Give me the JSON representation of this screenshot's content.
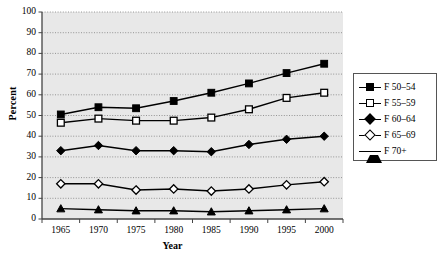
{
  "chart_data": {
    "type": "line",
    "title": "",
    "xlabel": "Year",
    "ylabel": "Percent",
    "categories": [
      "1965",
      "1970",
      "1975",
      "1980",
      "1985",
      "1990",
      "1995",
      "2000"
    ],
    "ylim": [
      0,
      100
    ],
    "yticks": [
      "0",
      "10",
      "20",
      "30",
      "40",
      "50",
      "60",
      "70",
      "80",
      "90",
      "100"
    ],
    "grid": true,
    "legend_position": "right",
    "plot_background": "#e8e8e8",
    "line_color": "#000000",
    "series": [
      {
        "name": "F 50–54",
        "marker": "filled-square",
        "values": [
          50.5,
          54.0,
          53.5,
          57.0,
          61.0,
          65.5,
          70.5,
          75.0
        ]
      },
      {
        "name": "F 55–59",
        "marker": "open-square",
        "values": [
          46.5,
          48.5,
          47.5,
          47.5,
          49.0,
          53.0,
          58.5,
          61.0
        ]
      },
      {
        "name": "F 60–64",
        "marker": "filled-diamond",
        "values": [
          33.0,
          35.5,
          33.0,
          33.0,
          32.5,
          36.0,
          38.5,
          40.0
        ]
      },
      {
        "name": "F 65–69",
        "marker": "open-diamond",
        "values": [
          17.0,
          17.0,
          14.0,
          14.5,
          13.5,
          14.5,
          16.5,
          18.0
        ]
      },
      {
        "name": "F 70+",
        "marker": "filled-triangle",
        "values": [
          5.0,
          4.5,
          4.0,
          4.0,
          3.5,
          4.0,
          4.5,
          5.0
        ]
      }
    ]
  }
}
